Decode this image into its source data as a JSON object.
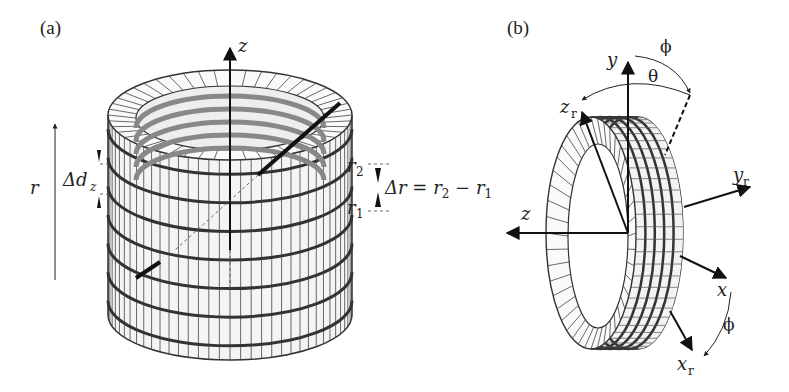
{
  "figure": {
    "panels": [
      {
        "id": "a",
        "label": "(a)",
        "subject": "stacked annular coil cylinder (multi-turn ring stack)",
        "labels": {
          "axis_z": "z",
          "axis_r": "r",
          "delta_dz": "Δd",
          "delta_dz_sub": "z",
          "r2": "r",
          "r2_sub": "2",
          "r1": "r",
          "r1_sub": "1",
          "delta_r_eq": "Δr = r",
          "delta_r_eq_sub1": "2",
          "delta_r_eq_mid": " − r",
          "delta_r_eq_sub2": "1"
        },
        "ring_count": 7
      },
      {
        "id": "b",
        "label": "(b)",
        "subject": "rotated ring coil with reference and rotated axes",
        "labels": {
          "axis_y": "y",
          "axis_z": "z",
          "axis_x": "x",
          "axis_zr": "z",
          "axis_zr_sub": "r",
          "axis_yr": "y",
          "axis_yr_sub": "r",
          "axis_xr": "x",
          "axis_xr_sub": "r",
          "angle_phi_top": "ϕ",
          "angle_theta": "θ",
          "angle_phi_bottom": "ϕ"
        },
        "ring_count": 4
      }
    ]
  }
}
